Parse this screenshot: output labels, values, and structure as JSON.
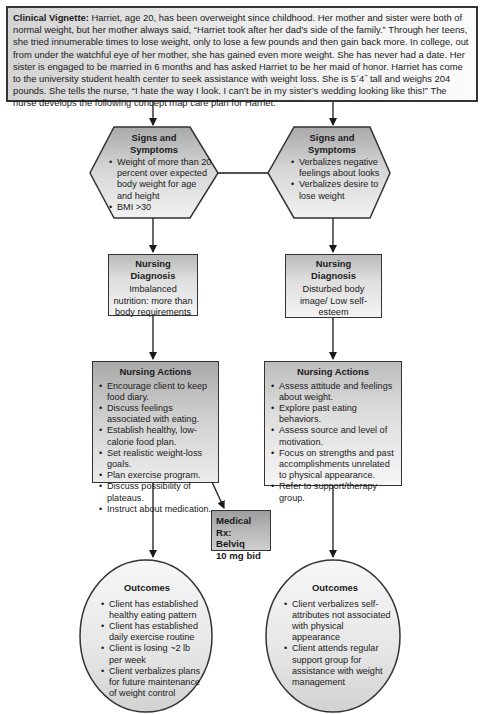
{
  "vignette": {
    "label": "Clinical Vignette:",
    "text": " Harriet, age 20, has been overweight since childhood. Her mother and sister were both of normal weight, but her mother always said, “Harriet took after her dad’s side of the family.” Through her teens, she tried innumerable times to lose weight, only to lose a few pounds and then gain back more. In college, out from under the watchful eye of her mother, she has gained even more weight. She has never had a date. Her sister is engaged to be married in 6 months and has asked Harriet to be her maid of honor. Harriet has come to the university student health center to seek assistance with weight loss. She is 5´4˝ tall and weighs 204 pounds. She tells the nurse, “I hate the way I look. I can’t be in my sister’s wedding looking like this!” The nurse develops the following concept map care plan for Harriet."
  },
  "left": {
    "signs": {
      "title": "Signs and Symptoms",
      "items": [
        "Weight of more than 20 percent over expected body weight for age and height",
        "BMI >30"
      ]
    },
    "diagnosis": {
      "title": "Nursing Diagnosis",
      "text": "Imbalanced nutrition: more than body requirements"
    },
    "actions": {
      "title": "Nursing Actions",
      "items": [
        "Encourage client to keep food diary.",
        "Discuss feelings associated with eating.",
        "Establish healthy, low-calorie food plan.",
        "Set realistic weight-loss goals.",
        "Plan exercise program.",
        "Discuss possibility of plateaus.",
        "Instruct about medication."
      ]
    },
    "outcomes": {
      "title": "Outcomes",
      "items": [
        "Client has established healthy eating pattern",
        "Client has established daily exercise routine",
        "Client is losing ~2 lb per week",
        "Client verbalizes plans for future maintenance of weight control"
      ]
    }
  },
  "right": {
    "signs": {
      "title": "Signs and Symptoms",
      "items": [
        "Verbalizes negative feelings about looks",
        "Verbalizes desire to lose weight"
      ]
    },
    "diagnosis": {
      "title": "Nursing Diagnosis",
      "text": "Disturbed body image/ Low self-esteem"
    },
    "actions": {
      "title": "Nursing Actions",
      "items": [
        "Assess attitude and feelings about weight.",
        "Explore past eating behaviors.",
        "Assess source and level of motivation.",
        "Focus on strengths and past accomplishments unrelated to physical appearance.",
        "Refer to support/therapy group."
      ]
    },
    "outcomes": {
      "title": "Outcomes",
      "items": [
        "Client verbalizes self-attributes not associated with physical appearance",
        "Client attends regular support group for assistance with weight management"
      ]
    }
  },
  "medical_rx": {
    "line1": "Medical Rx:",
    "line2": "Belviq",
    "line3": "10 mg bid"
  },
  "colors": {
    "stroke": "#333333",
    "fill_light": "#f4f4f4",
    "fill_dark": "#a9a9a9"
  }
}
